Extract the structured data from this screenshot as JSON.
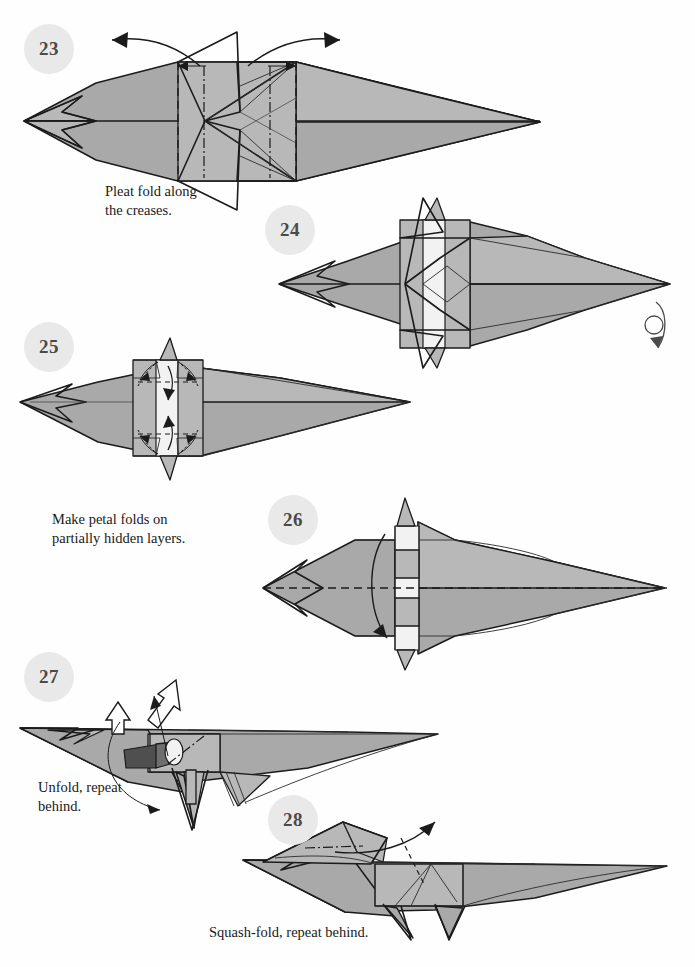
{
  "page": {
    "kind": "origami-instruction-page",
    "background_color": "#ffffff",
    "paper_fill_color": "#a9a9a9",
    "line_color": "#1b1b1b",
    "badge_fill_color": "#e9e9e9",
    "badge_text_color": "#4a4a4a"
  },
  "steps": [
    {
      "number": "23",
      "caption": "Pleat fold along\nthe creases.",
      "badge": {
        "x": 24,
        "y": 24
      },
      "caption_pos": {
        "x": 105,
        "y": 184
      },
      "fold_symbols": [
        "valley-fold-dashed",
        "mountain-fold-dash-dot",
        "pleat-arrows-outward"
      ],
      "arrow_count": 2
    },
    {
      "number": "24",
      "caption": "",
      "badge": {
        "x": 265,
        "y": 205
      },
      "caption_pos": null,
      "fold_symbols": [
        "turn-over-loop-arrow"
      ],
      "arrow_count": 1
    },
    {
      "number": "25",
      "caption": "Make petal folds on\npartially hidden layers.",
      "badge": {
        "x": 24,
        "y": 322
      },
      "caption_pos": {
        "x": 52,
        "y": 512
      },
      "fold_symbols": [
        "valley-fold-dashed",
        "petal-fold-arrows",
        "hidden-layer-dotted"
      ],
      "arrow_count": 6
    },
    {
      "number": "26",
      "caption": "",
      "badge": {
        "x": 268,
        "y": 495
      },
      "caption_pos": null,
      "fold_symbols": [
        "valley-fold-dashed-horizontal",
        "fold-down-arrow"
      ],
      "arrow_count": 1
    },
    {
      "number": "27",
      "caption": "Unfold, repeat\nbehind.",
      "badge": {
        "x": 24,
        "y": 652
      },
      "caption_pos": {
        "x": 38,
        "y": 780
      },
      "fold_symbols": [
        "hollow-unfold-arrow",
        "repeat-behind-arc",
        "mountain-fold-dash-dot"
      ],
      "arrow_count": 3
    },
    {
      "number": "28",
      "caption": "Squash-fold, repeat behind.",
      "badge": {
        "x": 268,
        "y": 795
      },
      "caption_pos": {
        "x": 209,
        "y": 925
      },
      "fold_symbols": [
        "mountain-fold-dash-dot",
        "squash-fold-arrow"
      ],
      "arrow_count": 1
    }
  ]
}
